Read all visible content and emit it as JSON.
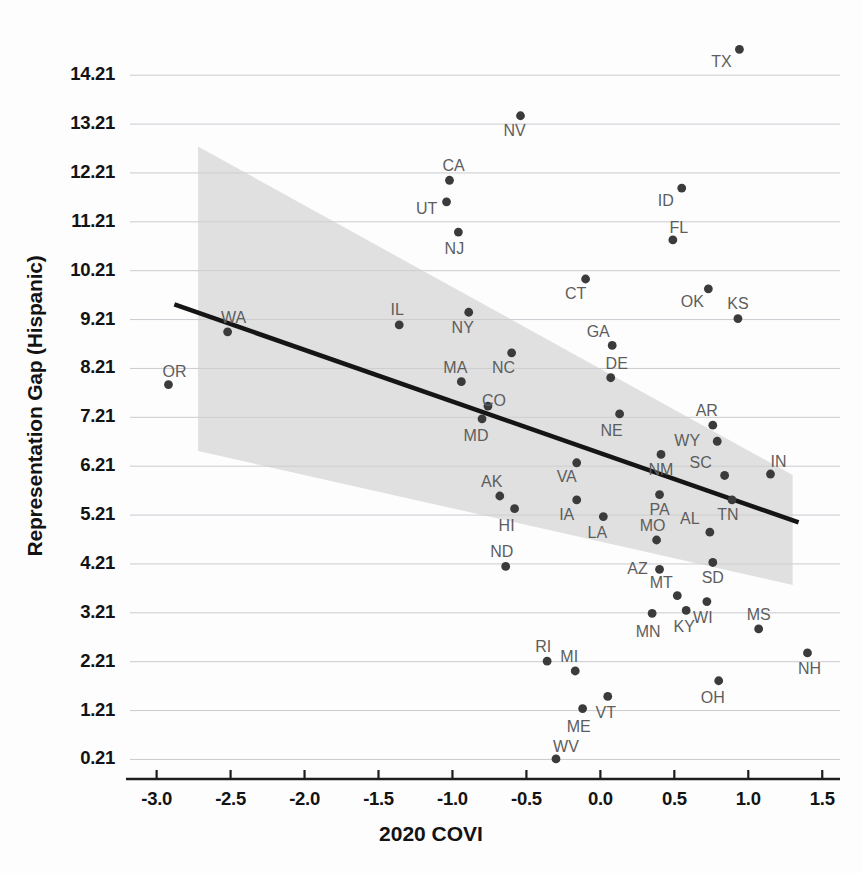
{
  "chart_data": {
    "type": "scatter",
    "title": "",
    "xlabel": "2020 COVI",
    "ylabel": "Representation Gap (Hispanic)",
    "xlim": [
      -3.18,
      1.62
    ],
    "ylim": [
      -0.19,
      14.93
    ],
    "grid": true,
    "legend": "none",
    "xticks": [
      "-3.0",
      "-2.5",
      "-2.0",
      "-1.5",
      "-1.0",
      "-0.5",
      "0.0",
      "0.5",
      "1.0",
      "1.5"
    ],
    "xtick_values": [
      -3.0,
      -2.5,
      -2.0,
      -1.5,
      -1.0,
      -0.5,
      0.0,
      0.5,
      1.0,
      1.5
    ],
    "yticks": [
      "0.21",
      "1.21",
      "2.21",
      "3.21",
      "4.21",
      "5.21",
      "6.21",
      "7.21",
      "8.21",
      "9.21",
      "10.21",
      "11.21",
      "12.21",
      "13.21",
      "14.21"
    ],
    "ytick_values": [
      0.21,
      1.21,
      2.21,
      3.21,
      4.21,
      5.21,
      6.21,
      7.21,
      8.21,
      9.21,
      10.21,
      11.21,
      12.21,
      13.21,
      14.21
    ],
    "point_label_field": "state",
    "points": [
      {
        "state": "TX",
        "x": 0.94,
        "y": 14.74,
        "lx": -18,
        "ly": 18
      },
      {
        "state": "NV",
        "x": -0.54,
        "y": 13.38,
        "lx": -6,
        "ly": 20
      },
      {
        "state": "CA",
        "x": -1.02,
        "y": 12.06,
        "lx": 4,
        "ly": -9
      },
      {
        "state": "UT",
        "x": -1.04,
        "y": 11.62,
        "lx": -20,
        "ly": 12
      },
      {
        "state": "ID",
        "x": 0.55,
        "y": 11.9,
        "lx": -16,
        "ly": 18
      },
      {
        "state": "NJ",
        "x": -0.96,
        "y": 11.0,
        "lx": -4,
        "ly": 22
      },
      {
        "state": "FL",
        "x": 0.49,
        "y": 10.84,
        "lx": 6,
        "ly": -7
      },
      {
        "state": "CT",
        "x": -0.1,
        "y": 10.04,
        "lx": -10,
        "ly": 20
      },
      {
        "state": "OK",
        "x": 0.73,
        "y": 9.84,
        "lx": -16,
        "ly": 18
      },
      {
        "state": "KS",
        "x": 0.93,
        "y": 9.23,
        "lx": 0,
        "ly": -10
      },
      {
        "state": "IL",
        "x": -1.36,
        "y": 9.1,
        "lx": -2,
        "ly": -10
      },
      {
        "state": "WA",
        "x": -2.52,
        "y": 8.96,
        "lx": 6,
        "ly": -9
      },
      {
        "state": "NY",
        "x": -0.89,
        "y": 9.36,
        "lx": -6,
        "ly": 21
      },
      {
        "state": "GA",
        "x": 0.08,
        "y": 8.68,
        "lx": -14,
        "ly": -8
      },
      {
        "state": "DE",
        "x": 0.07,
        "y": 8.02,
        "lx": 6,
        "ly": -9
      },
      {
        "state": "NC",
        "x": -0.6,
        "y": 8.53,
        "lx": -8,
        "ly": 20
      },
      {
        "state": "MA",
        "x": -0.94,
        "y": 7.94,
        "lx": -6,
        "ly": -9
      },
      {
        "state": "OR",
        "x": -2.92,
        "y": 7.88,
        "lx": 6,
        "ly": -8
      },
      {
        "state": "AR",
        "x": 0.76,
        "y": 7.05,
        "lx": -6,
        "ly": -9
      },
      {
        "state": "CO",
        "x": -0.76,
        "y": 7.44,
        "lx": 6,
        "ly": 0
      },
      {
        "state": "MD",
        "x": -0.8,
        "y": 7.18,
        "lx": -6,
        "ly": 22
      },
      {
        "state": "NE",
        "x": 0.13,
        "y": 7.28,
        "lx": -8,
        "ly": 22
      },
      {
        "state": "WY",
        "x": 0.79,
        "y": 6.72,
        "lx": -30,
        "ly": 5
      },
      {
        "state": "SC",
        "x": 0.84,
        "y": 6.02,
        "lx": -24,
        "ly": -7
      },
      {
        "state": "IN",
        "x": 1.15,
        "y": 6.05,
        "lx": 8,
        "ly": -7
      },
      {
        "state": "VA",
        "x": -0.16,
        "y": 6.28,
        "lx": -10,
        "ly": 19
      },
      {
        "state": "NM",
        "x": 0.41,
        "y": 6.45,
        "lx": 0,
        "ly": 21
      },
      {
        "state": "PA",
        "x": 0.4,
        "y": 5.63,
        "lx": 0,
        "ly": 20
      },
      {
        "state": "TN",
        "x": 0.89,
        "y": 5.52,
        "lx": -4,
        "ly": 20
      },
      {
        "state": "AK",
        "x": -0.68,
        "y": 5.6,
        "lx": -8,
        "ly": -9
      },
      {
        "state": "HI",
        "x": -0.58,
        "y": 5.34,
        "lx": -8,
        "ly": 22
      },
      {
        "state": "IA",
        "x": -0.16,
        "y": 5.52,
        "lx": -10,
        "ly": 20
      },
      {
        "state": "LA",
        "x": 0.02,
        "y": 5.18,
        "lx": -6,
        "ly": 21
      },
      {
        "state": "AL",
        "x": 0.74,
        "y": 4.86,
        "lx": -20,
        "ly": -8
      },
      {
        "state": "MO",
        "x": 0.38,
        "y": 4.7,
        "lx": -4,
        "ly": -9
      },
      {
        "state": "SD",
        "x": 0.76,
        "y": 4.24,
        "lx": 0,
        "ly": 21
      },
      {
        "state": "AZ",
        "x": 0.4,
        "y": 4.1,
        "lx": -22,
        "ly": 5
      },
      {
        "state": "ND",
        "x": -0.64,
        "y": 4.16,
        "lx": -4,
        "ly": -9
      },
      {
        "state": "MT",
        "x": 0.52,
        "y": 3.56,
        "lx": -16,
        "ly": -8
      },
      {
        "state": "WI",
        "x": 0.72,
        "y": 3.44,
        "lx": -4,
        "ly": 21
      },
      {
        "state": "KY",
        "x": 0.58,
        "y": 3.26,
        "lx": -2,
        "ly": 22
      },
      {
        "state": "MN",
        "x": 0.35,
        "y": 3.2,
        "lx": -4,
        "ly": 24
      },
      {
        "state": "MS",
        "x": 1.07,
        "y": 2.88,
        "lx": 0,
        "ly": -9
      },
      {
        "state": "NH",
        "x": 1.4,
        "y": 2.39,
        "lx": 2,
        "ly": 21
      },
      {
        "state": "RI",
        "x": -0.36,
        "y": 2.22,
        "lx": -4,
        "ly": -9
      },
      {
        "state": "MI",
        "x": -0.17,
        "y": 2.02,
        "lx": -6,
        "ly": -9
      },
      {
        "state": "OH",
        "x": 0.8,
        "y": 1.82,
        "lx": -6,
        "ly": 22
      },
      {
        "state": "VT",
        "x": 0.05,
        "y": 1.5,
        "lx": -2,
        "ly": 22
      },
      {
        "state": "ME",
        "x": -0.12,
        "y": 1.25,
        "lx": -4,
        "ly": 23
      },
      {
        "state": "WV",
        "x": -0.3,
        "y": 0.22,
        "lx": 10,
        "ly": -7
      }
    ],
    "fit_line": {
      "x_start": -2.88,
      "y_start": 9.52,
      "x_end": 1.34,
      "y_end": 5.06,
      "color": "#151515"
    },
    "confidence_band": {
      "x_start": -2.72,
      "x_end": 1.3,
      "upper_start": 12.75,
      "upper_end": 6.03,
      "lower_start": 6.52,
      "lower_end": 3.78,
      "color": "#cfcfcf"
    }
  }
}
